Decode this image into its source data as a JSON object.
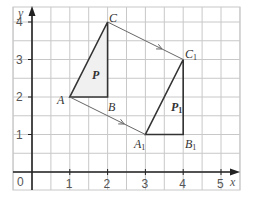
{
  "diagram": {
    "type": "translation-grid",
    "axes": {
      "x_label": "x",
      "y_label": "y",
      "origin_label": "0",
      "x_ticks": [
        "1",
        "2",
        "3",
        "4",
        "5"
      ],
      "y_ticks": [
        "1",
        "2",
        "3",
        "4"
      ]
    },
    "grid": {
      "x_min": -0.5,
      "x_max": 5.5,
      "y_min": -0.5,
      "y_max": 4.4,
      "step": 0.5
    },
    "shapes": [
      {
        "name": "P",
        "label": "P",
        "vertices": [
          {
            "label": "A",
            "x": 1,
            "y": 2
          },
          {
            "label": "B",
            "x": 2,
            "y": 2
          },
          {
            "label": "C",
            "x": 2,
            "y": 4
          }
        ]
      },
      {
        "name": "P1",
        "label": "P",
        "label_sub": "1",
        "vertices": [
          {
            "label": "A",
            "sub": "1",
            "x": 3,
            "y": 1
          },
          {
            "label": "B",
            "sub": "1",
            "x": 4,
            "y": 1
          },
          {
            "label": "C",
            "sub": "1",
            "x": 4,
            "y": 3
          }
        ]
      }
    ],
    "translation_arrows": [
      {
        "from": "C",
        "to": "C1"
      },
      {
        "from": "A",
        "to": "A1"
      }
    ],
    "colors": {
      "grid": "#c8c8c8",
      "axis": "#222222",
      "shape_stroke": "#333333",
      "shape_fill": "#f0f0f0",
      "arrow": "#666666",
      "text": "#333333",
      "tick_text": "#555555"
    }
  }
}
